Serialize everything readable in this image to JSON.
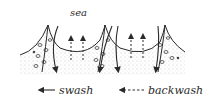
{
  "diagram": {
    "region_label": "sea",
    "legend": [
      {
        "symbol": "solid-arrow",
        "label": "swash"
      },
      {
        "symbol": "dashed-arrow",
        "label": "backwash"
      }
    ],
    "colors": {
      "ink": "#2a2a2a",
      "sand_stipple": "#8a8a8a",
      "background": "#ffffff"
    }
  }
}
